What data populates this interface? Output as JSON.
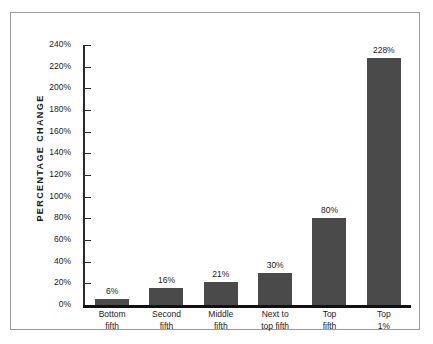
{
  "chart_data": {
    "type": "bar",
    "title": "",
    "subtitle": "",
    "xlabel": "",
    "ylabel": "PERCENTAGE CHANGE",
    "categories": [
      "Bottom fifth",
      "Second fifth",
      "Middle fifth",
      "Next to top fifth",
      "Top fifth",
      "Top 1%"
    ],
    "category_lines": [
      [
        "Bottom",
        "fifth"
      ],
      [
        "Second",
        "fifth"
      ],
      [
        "Middle",
        "fifth"
      ],
      [
        "Next to",
        "top fifth"
      ],
      [
        "Top",
        "fifth"
      ],
      [
        "Top",
        "1%"
      ]
    ],
    "values": [
      6,
      16,
      21,
      30,
      80,
      228
    ],
    "value_labels": [
      "6%",
      "16%",
      "21%",
      "30%",
      "80%",
      "228%"
    ],
    "ylim": [
      0,
      240
    ],
    "ytick_values": [
      0,
      20,
      40,
      60,
      80,
      100,
      120,
      140,
      160,
      180,
      200,
      220,
      240
    ],
    "ytick_labels": [
      "0%",
      "20%",
      "40%",
      "60%",
      "80%",
      "100%",
      "120%",
      "140%",
      "160%",
      "180%",
      "200%",
      "220%",
      "240%"
    ],
    "grid": false,
    "legend": null,
    "colors": {
      "bar_fill": "#4a4a4a",
      "axis": "#111111",
      "text": "#1b1b1b",
      "frame_border": "#9a9a9a",
      "background": "#ffffff"
    }
  }
}
